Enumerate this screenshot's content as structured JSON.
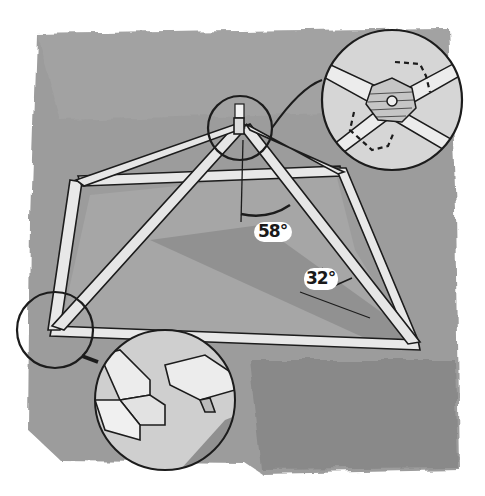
{
  "illustration": {
    "subject": "Hip roof timber frame with joinery details",
    "colors": {
      "wash": "#9a9a9a",
      "wash_dark": "#7d7d7d",
      "wood": "#e6e6e6",
      "ink": "#1c1c1c",
      "paper": "#ffffff"
    },
    "annotations": {
      "rafter_angle": "58°",
      "hip_angle": "32°"
    },
    "details": [
      {
        "name": "apex-detail",
        "description": "Octagonal hub with central bolt where four hip rafters meet"
      },
      {
        "name": "corner-detail",
        "description": "Lap joint at base plate corner"
      },
      {
        "name": "apex-top-view",
        "description": "Top view of hub with rafter ends"
      }
    ]
  }
}
